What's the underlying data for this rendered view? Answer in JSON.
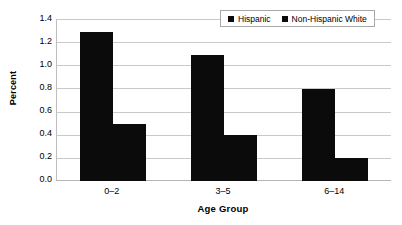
{
  "chart_data": {
    "type": "bar",
    "title": "",
    "xlabel": "Age Group",
    "ylabel": "Percent",
    "categories": [
      "0–2",
      "3–5",
      "6–14"
    ],
    "series": [
      {
        "name": "Hispanic",
        "values": [
          1.3,
          1.1,
          0.8
        ],
        "color": "#0b0b0b"
      },
      {
        "name": "Non-Hispanic White",
        "values": [
          0.5,
          0.4,
          0.2
        ],
        "color": "#0b0b0b"
      }
    ],
    "ylim": [
      0.0,
      1.4
    ],
    "ytick_step": 0.2,
    "ytick_labels": [
      "1.4",
      "1.2",
      "1.0",
      "0.8",
      "0.6",
      "0.4",
      "0.2",
      "0.0"
    ],
    "grid": true,
    "grid_color": "#c9c9c9",
    "legend_position": "top-right",
    "legend": [
      "Hispanic",
      "Non-Hispanic White"
    ]
  }
}
